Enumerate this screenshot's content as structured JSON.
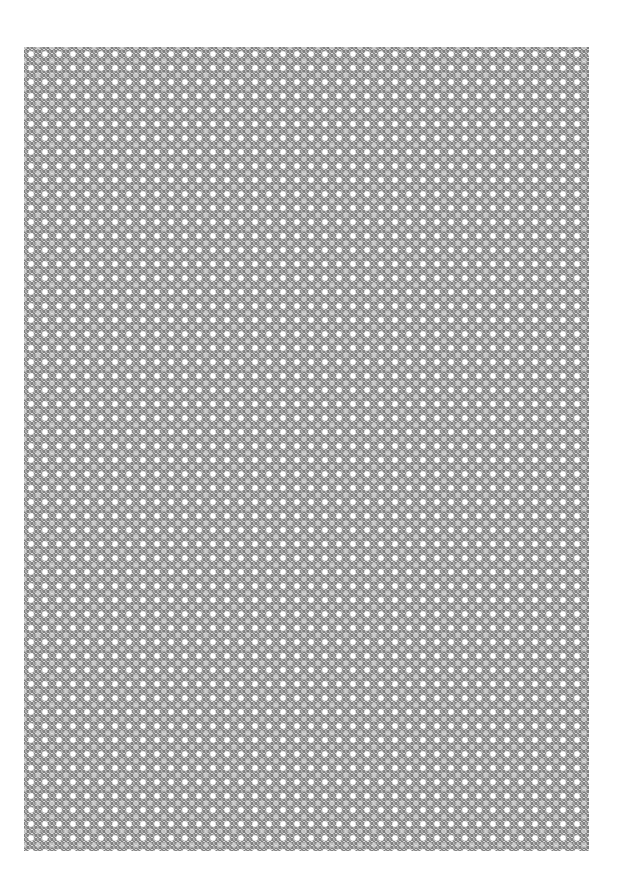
{
  "canvas": {
    "width": 619,
    "height": 895,
    "background": "#ffffff"
  },
  "pattern": {
    "description": "Repeating gray diamond/lattice texture with light circular spots",
    "bounds": {
      "x": 24,
      "y": 47,
      "width": 565,
      "height": 804
    },
    "tile_size_px": 14,
    "colors": {
      "base": "#b4b4b4",
      "dark": "#8a8a8a",
      "light": "#ffffff"
    }
  }
}
